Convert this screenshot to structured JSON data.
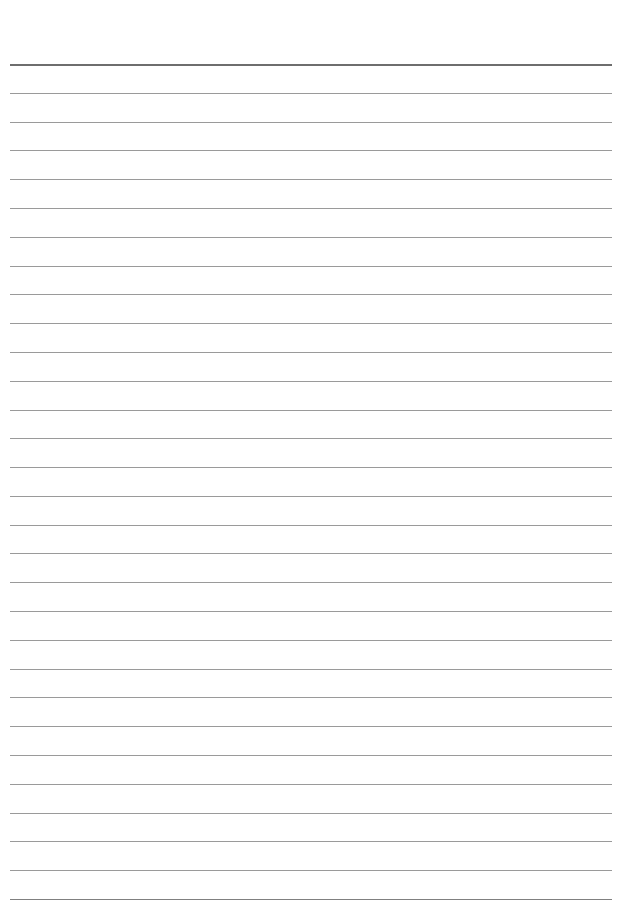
{
  "page": {
    "type": "lined-paper",
    "background": "#ffffff",
    "line_color": "#9a9a9a",
    "top_line_color": "#6e6e6e",
    "line_count": 30,
    "first_line_y": 64,
    "last_line_y": 899
  }
}
